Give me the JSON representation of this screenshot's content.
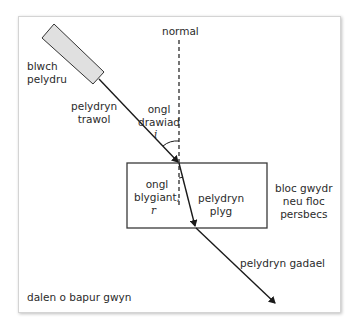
{
  "diagram": {
    "type": "ray-refraction-through-glass-block",
    "labels": {
      "ray_box": "blwch\npelydru",
      "normal": "normal",
      "incident_ray": "pelydryn\ntrawol",
      "angle_incidence": "ongl\ndrawiad",
      "angle_incidence_symbol": "i",
      "angle_refraction": "ongl\nblygiant,",
      "angle_refraction_symbol": "r",
      "refracted_ray": "pelydryn\nplyg",
      "block": "bloc gwydr\nneu floc\npersbecs",
      "emergent_ray": "pelydryn gadael",
      "paper": "dalen o bapur gwyn"
    },
    "colors": {
      "line": "#1a1a1a",
      "ray_box_fill": "#e0e0e0",
      "block_outline": "#3a3a3a",
      "paper_border": "#d4d4d4"
    }
  }
}
